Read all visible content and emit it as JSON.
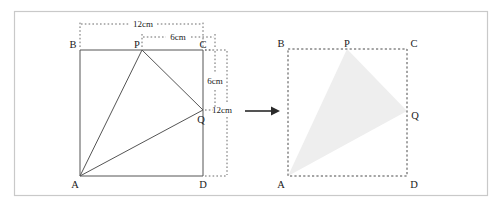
{
  "figure": {
    "outer_frame": {
      "color": "#c9c9c9"
    },
    "arrow": {
      "name": "transformation-arrow"
    },
    "left_diagram": {
      "name": "left-square-diagram",
      "square_labels": {
        "top_left": "B",
        "top_right": "C",
        "bottom_left": "A",
        "bottom_right": "D"
      },
      "point_labels": {
        "p": "P",
        "q": "Q"
      },
      "dimensions": [
        {
          "label": "12cm",
          "name": "dim-bc-12cm",
          "orientation": "horizontal"
        },
        {
          "label": "6cm",
          "name": "dim-pc-6cm",
          "orientation": "horizontal"
        },
        {
          "label": "6cm",
          "name": "dim-cq-6cm",
          "orientation": "vertical"
        },
        {
          "label": "12cm",
          "name": "dim-cd-12cm",
          "orientation": "vertical"
        }
      ]
    },
    "right_diagram": {
      "name": "right-square-diagram",
      "square_labels": {
        "top_left": "B",
        "top_right": "C",
        "bottom_left": "A",
        "bottom_right": "D"
      },
      "point_labels": {
        "p": "P",
        "q": "Q"
      },
      "shaded_region": {
        "name": "shaded-triangle-apq",
        "color": "#eeeeee"
      }
    }
  },
  "geometry": {
    "left": {
      "A": [
        80,
        176
      ],
      "B": [
        80,
        50
      ],
      "C": [
        203,
        50
      ],
      "D": [
        203,
        176
      ],
      "P": [
        142,
        50
      ],
      "Q": [
        203,
        110
      ]
    },
    "right": {
      "A": [
        288,
        176
      ],
      "B": [
        288,
        49
      ],
      "C": [
        407,
        49
      ],
      "D": [
        407,
        176
      ],
      "P": [
        347,
        49
      ],
      "Q": [
        407,
        111
      ]
    }
  }
}
